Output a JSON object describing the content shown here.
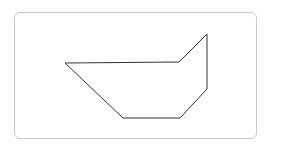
{
  "diagram": {
    "type": "polygon-outline",
    "frame": {
      "x": 14,
      "y": 12,
      "width": 243,
      "height": 127,
      "radius": 6,
      "border_color": "#c8c8c8"
    },
    "shape": {
      "stroke_color": "#333333",
      "stroke_width": 1,
      "fill": "none",
      "points": "65,63 179,62 207,34 207,89 180,118 123,118"
    }
  }
}
